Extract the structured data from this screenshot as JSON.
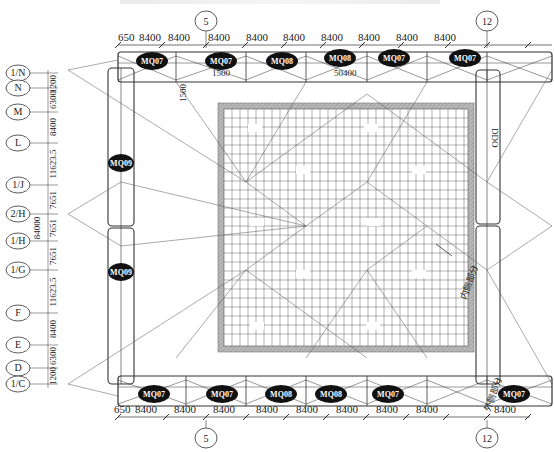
{
  "figure": {
    "title_partial": "",
    "type": "structural plan drawing"
  },
  "top_axes": [
    {
      "label": "5",
      "x": 206
    },
    {
      "label": "12",
      "x": 487
    }
  ],
  "bottom_axes": [
    {
      "label": "5",
      "x": 206
    },
    {
      "label": "12",
      "x": 487
    }
  ],
  "top_dimensions": [
    "650",
    "8400",
    "8400",
    "8400",
    "8400",
    "8400",
    "8400",
    "8400",
    "8400",
    "8400"
  ],
  "bottom_dimensions": [
    "650",
    "8400",
    "8400",
    "8400",
    "8400",
    "8400",
    "8400",
    "8400",
    "8400",
    "8400"
  ],
  "left_axes": [
    {
      "label": "1/N",
      "y": 73
    },
    {
      "label": "N",
      "y": 88
    },
    {
      "label": "M",
      "y": 112
    },
    {
      "label": "L",
      "y": 143
    },
    {
      "label": "1/J",
      "y": 185
    },
    {
      "label": "2/H",
      "y": 214
    },
    {
      "label": "1/H",
      "y": 241
    },
    {
      "label": "1/G",
      "y": 270
    },
    {
      "label": "F",
      "y": 313
    },
    {
      "label": "E",
      "y": 345
    },
    {
      "label": "D",
      "y": 368
    },
    {
      "label": "1/C",
      "y": 384
    }
  ],
  "left_dimensions": [
    {
      "text": "1200",
      "y": 80
    },
    {
      "text": "6300",
      "y": 100
    },
    {
      "text": "8400",
      "y": 127
    },
    {
      "text": "11623.5",
      "y": 164
    },
    {
      "text": "7651",
      "y": 200
    },
    {
      "text": "7651",
      "y": 228
    },
    {
      "text": "7651",
      "y": 256
    },
    {
      "text": "11623.5",
      "y": 292
    },
    {
      "text": "8400",
      "y": 329
    },
    {
      "text": "6300",
      "y": 356
    },
    {
      "text": "1200",
      "y": 376
    }
  ],
  "overall_dimension_vertical": "84000",
  "overall_dimension_top": "50400",
  "annotations": {
    "top_offset": "1500",
    "vertical_offset": "1500",
    "right_side_label": "DDO",
    "right_inner_label": "内侧部分",
    "bottom_right_label": "外侧部分"
  },
  "top_modules": [
    "MQ07",
    "MQ07",
    "MQ08",
    "MQ08",
    "MQ07",
    "MQ07"
  ],
  "bottom_modules": [
    "MQ07",
    "MQ07",
    "MQ08",
    "MQ08",
    "MQ07",
    "MQ07"
  ],
  "left_modules": [
    "MQ09",
    "MQ09"
  ],
  "colors": {
    "line": "#333333",
    "hatch": "#9a9a9a",
    "module_fill": "#111111",
    "module_text": "#ffffff"
  }
}
